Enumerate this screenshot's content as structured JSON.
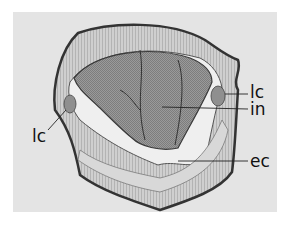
{
  "figure": {
    "background_color": "#e4e4e4",
    "labels": [
      {
        "id": "lc_right",
        "text": "lc"
      },
      {
        "id": "in",
        "text": "in"
      },
      {
        "id": "lc_left",
        "text": "lc"
      },
      {
        "id": "ec",
        "text": "ec"
      }
    ]
  }
}
